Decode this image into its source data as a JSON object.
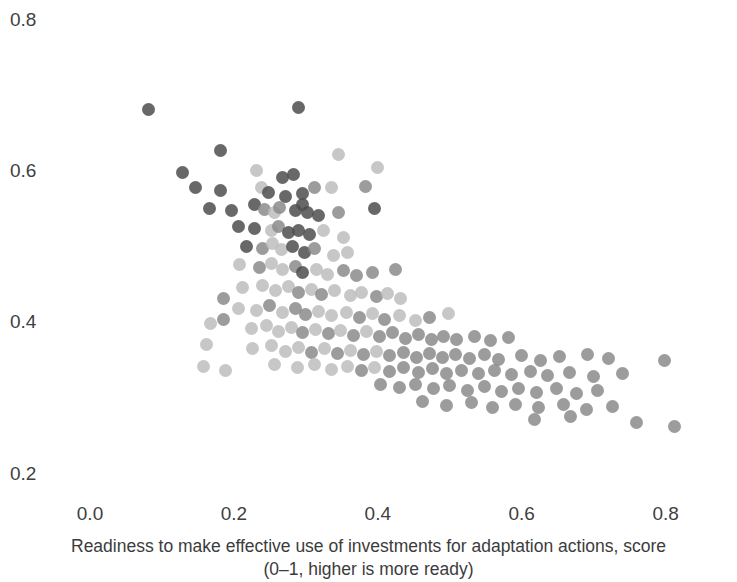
{
  "chart_data": {
    "type": "scatter",
    "title": "",
    "subtitle": "",
    "xlabel": "Readiness to make effective use of investments for adaptation actions, score (0–1, higher is more ready)",
    "xlabel_line1": "Readiness to make effective use of investments for adaptation actions, score",
    "xlabel_line2": "(0–1, higher is more ready)",
    "ylabel": "",
    "xlim": [
      -0.02,
      0.9
    ],
    "ylim": [
      0.175,
      0.82
    ],
    "xticks": [
      "0.0",
      "0.2",
      "0.4",
      "0.6",
      "0.8"
    ],
    "xtick_values": [
      0.0,
      0.2,
      0.4,
      0.6,
      0.8
    ],
    "yticks": [
      "0.2",
      "0.4",
      "0.6",
      "0.8"
    ],
    "ytick_values": [
      0.2,
      0.4,
      0.6,
      0.8
    ],
    "grid": false,
    "legend": "none",
    "marker": "circle",
    "marker_size_px": 13,
    "marker_opacity": 0.85,
    "colors": {
      "dark": "#4e4e4e",
      "medium": "#8b8b8b",
      "light": "#bdbdbd",
      "axis_text": "#3f3f3f",
      "label_text": "#3c3c3c",
      "background": "#ffffff"
    },
    "n_points": 185,
    "points": [
      {
        "x": 0.081,
        "y": 0.681,
        "c": "dark"
      },
      {
        "x": 0.29,
        "y": 0.684,
        "c": "dark"
      },
      {
        "x": 0.182,
        "y": 0.627,
        "c": "dark"
      },
      {
        "x": 0.345,
        "y": 0.622,
        "c": "light"
      },
      {
        "x": 0.4,
        "y": 0.605,
        "c": "light"
      },
      {
        "x": 0.128,
        "y": 0.598,
        "c": "dark"
      },
      {
        "x": 0.232,
        "y": 0.601,
        "c": "light"
      },
      {
        "x": 0.268,
        "y": 0.592,
        "c": "dark"
      },
      {
        "x": 0.283,
        "y": 0.596,
        "c": "dark"
      },
      {
        "x": 0.147,
        "y": 0.578,
        "c": "dark"
      },
      {
        "x": 0.182,
        "y": 0.575,
        "c": "dark"
      },
      {
        "x": 0.238,
        "y": 0.578,
        "c": "light"
      },
      {
        "x": 0.248,
        "y": 0.572,
        "c": "dark"
      },
      {
        "x": 0.272,
        "y": 0.566,
        "c": "dark"
      },
      {
        "x": 0.296,
        "y": 0.571,
        "c": "dark"
      },
      {
        "x": 0.312,
        "y": 0.578,
        "c": "medium"
      },
      {
        "x": 0.336,
        "y": 0.578,
        "c": "light"
      },
      {
        "x": 0.383,
        "y": 0.58,
        "c": "medium"
      },
      {
        "x": 0.166,
        "y": 0.551,
        "c": "dark"
      },
      {
        "x": 0.196,
        "y": 0.548,
        "c": "dark"
      },
      {
        "x": 0.228,
        "y": 0.556,
        "c": "dark"
      },
      {
        "x": 0.242,
        "y": 0.549,
        "c": "medium"
      },
      {
        "x": 0.256,
        "y": 0.546,
        "c": "light"
      },
      {
        "x": 0.264,
        "y": 0.552,
        "c": "medium"
      },
      {
        "x": 0.285,
        "y": 0.548,
        "c": "dark"
      },
      {
        "x": 0.295,
        "y": 0.556,
        "c": "dark"
      },
      {
        "x": 0.302,
        "y": 0.546,
        "c": "dark"
      },
      {
        "x": 0.318,
        "y": 0.542,
        "c": "dark"
      },
      {
        "x": 0.345,
        "y": 0.545,
        "c": "medium"
      },
      {
        "x": 0.395,
        "y": 0.551,
        "c": "dark"
      },
      {
        "x": 0.206,
        "y": 0.527,
        "c": "dark"
      },
      {
        "x": 0.228,
        "y": 0.524,
        "c": "dark"
      },
      {
        "x": 0.252,
        "y": 0.522,
        "c": "light"
      },
      {
        "x": 0.262,
        "y": 0.527,
        "c": "medium"
      },
      {
        "x": 0.276,
        "y": 0.519,
        "c": "dark"
      },
      {
        "x": 0.29,
        "y": 0.522,
        "c": "dark"
      },
      {
        "x": 0.305,
        "y": 0.516,
        "c": "dark"
      },
      {
        "x": 0.325,
        "y": 0.521,
        "c": "light"
      },
      {
        "x": 0.352,
        "y": 0.512,
        "c": "light"
      },
      {
        "x": 0.218,
        "y": 0.501,
        "c": "dark"
      },
      {
        "x": 0.24,
        "y": 0.498,
        "c": "medium"
      },
      {
        "x": 0.254,
        "y": 0.505,
        "c": "light"
      },
      {
        "x": 0.266,
        "y": 0.496,
        "c": "light"
      },
      {
        "x": 0.282,
        "y": 0.5,
        "c": "dark"
      },
      {
        "x": 0.298,
        "y": 0.492,
        "c": "dark"
      },
      {
        "x": 0.312,
        "y": 0.498,
        "c": "medium"
      },
      {
        "x": 0.338,
        "y": 0.489,
        "c": "light"
      },
      {
        "x": 0.358,
        "y": 0.493,
        "c": "light"
      },
      {
        "x": 0.208,
        "y": 0.476,
        "c": "light"
      },
      {
        "x": 0.236,
        "y": 0.472,
        "c": "medium"
      },
      {
        "x": 0.252,
        "y": 0.478,
        "c": "light"
      },
      {
        "x": 0.268,
        "y": 0.47,
        "c": "light"
      },
      {
        "x": 0.285,
        "y": 0.474,
        "c": "medium"
      },
      {
        "x": 0.296,
        "y": 0.466,
        "c": "dark"
      },
      {
        "x": 0.315,
        "y": 0.47,
        "c": "light"
      },
      {
        "x": 0.33,
        "y": 0.463,
        "c": "light"
      },
      {
        "x": 0.352,
        "y": 0.468,
        "c": "medium"
      },
      {
        "x": 0.37,
        "y": 0.462,
        "c": "medium"
      },
      {
        "x": 0.392,
        "y": 0.466,
        "c": "medium"
      },
      {
        "x": 0.425,
        "y": 0.47,
        "c": "medium"
      },
      {
        "x": 0.212,
        "y": 0.446,
        "c": "light"
      },
      {
        "x": 0.24,
        "y": 0.449,
        "c": "light"
      },
      {
        "x": 0.258,
        "y": 0.442,
        "c": "light"
      },
      {
        "x": 0.276,
        "y": 0.447,
        "c": "light"
      },
      {
        "x": 0.29,
        "y": 0.44,
        "c": "medium"
      },
      {
        "x": 0.308,
        "y": 0.444,
        "c": "light"
      },
      {
        "x": 0.322,
        "y": 0.437,
        "c": "medium"
      },
      {
        "x": 0.34,
        "y": 0.442,
        "c": "light"
      },
      {
        "x": 0.362,
        "y": 0.436,
        "c": "light"
      },
      {
        "x": 0.378,
        "y": 0.44,
        "c": "light"
      },
      {
        "x": 0.398,
        "y": 0.434,
        "c": "medium"
      },
      {
        "x": 0.414,
        "y": 0.438,
        "c": "light"
      },
      {
        "x": 0.432,
        "y": 0.432,
        "c": "light"
      },
      {
        "x": 0.186,
        "y": 0.432,
        "c": "medium"
      },
      {
        "x": 0.206,
        "y": 0.419,
        "c": "light"
      },
      {
        "x": 0.232,
        "y": 0.416,
        "c": "light"
      },
      {
        "x": 0.25,
        "y": 0.422,
        "c": "medium"
      },
      {
        "x": 0.268,
        "y": 0.413,
        "c": "light"
      },
      {
        "x": 0.286,
        "y": 0.418,
        "c": "medium"
      },
      {
        "x": 0.3,
        "y": 0.41,
        "c": "medium"
      },
      {
        "x": 0.318,
        "y": 0.415,
        "c": "light"
      },
      {
        "x": 0.336,
        "y": 0.409,
        "c": "light"
      },
      {
        "x": 0.356,
        "y": 0.413,
        "c": "light"
      },
      {
        "x": 0.374,
        "y": 0.406,
        "c": "medium"
      },
      {
        "x": 0.392,
        "y": 0.412,
        "c": "light"
      },
      {
        "x": 0.41,
        "y": 0.404,
        "c": "medium"
      },
      {
        "x": 0.43,
        "y": 0.409,
        "c": "light"
      },
      {
        "x": 0.452,
        "y": 0.403,
        "c": "light"
      },
      {
        "x": 0.472,
        "y": 0.407,
        "c": "medium"
      },
      {
        "x": 0.498,
        "y": 0.412,
        "c": "light"
      },
      {
        "x": 0.186,
        "y": 0.404,
        "c": "medium"
      },
      {
        "x": 0.168,
        "y": 0.398,
        "c": "light"
      },
      {
        "x": 0.224,
        "y": 0.392,
        "c": "light"
      },
      {
        "x": 0.246,
        "y": 0.396,
        "c": "light"
      },
      {
        "x": 0.262,
        "y": 0.388,
        "c": "light"
      },
      {
        "x": 0.28,
        "y": 0.393,
        "c": "light"
      },
      {
        "x": 0.296,
        "y": 0.386,
        "c": "medium"
      },
      {
        "x": 0.314,
        "y": 0.391,
        "c": "light"
      },
      {
        "x": 0.332,
        "y": 0.385,
        "c": "medium"
      },
      {
        "x": 0.348,
        "y": 0.389,
        "c": "light"
      },
      {
        "x": 0.366,
        "y": 0.383,
        "c": "medium"
      },
      {
        "x": 0.384,
        "y": 0.388,
        "c": "light"
      },
      {
        "x": 0.402,
        "y": 0.381,
        "c": "medium"
      },
      {
        "x": 0.42,
        "y": 0.386,
        "c": "medium"
      },
      {
        "x": 0.438,
        "y": 0.379,
        "c": "medium"
      },
      {
        "x": 0.456,
        "y": 0.384,
        "c": "medium"
      },
      {
        "x": 0.474,
        "y": 0.378,
        "c": "medium"
      },
      {
        "x": 0.492,
        "y": 0.382,
        "c": "medium"
      },
      {
        "x": 0.51,
        "y": 0.377,
        "c": "medium"
      },
      {
        "x": 0.534,
        "y": 0.382,
        "c": "medium"
      },
      {
        "x": 0.556,
        "y": 0.376,
        "c": "medium"
      },
      {
        "x": 0.582,
        "y": 0.38,
        "c": "medium"
      },
      {
        "x": 0.162,
        "y": 0.371,
        "c": "light"
      },
      {
        "x": 0.226,
        "y": 0.365,
        "c": "light"
      },
      {
        "x": 0.252,
        "y": 0.369,
        "c": "light"
      },
      {
        "x": 0.272,
        "y": 0.362,
        "c": "light"
      },
      {
        "x": 0.29,
        "y": 0.367,
        "c": "light"
      },
      {
        "x": 0.308,
        "y": 0.36,
        "c": "medium"
      },
      {
        "x": 0.326,
        "y": 0.365,
        "c": "light"
      },
      {
        "x": 0.344,
        "y": 0.359,
        "c": "medium"
      },
      {
        "x": 0.362,
        "y": 0.363,
        "c": "light"
      },
      {
        "x": 0.38,
        "y": 0.357,
        "c": "medium"
      },
      {
        "x": 0.398,
        "y": 0.362,
        "c": "light"
      },
      {
        "x": 0.416,
        "y": 0.356,
        "c": "medium"
      },
      {
        "x": 0.436,
        "y": 0.36,
        "c": "medium"
      },
      {
        "x": 0.454,
        "y": 0.354,
        "c": "medium"
      },
      {
        "x": 0.472,
        "y": 0.359,
        "c": "medium"
      },
      {
        "x": 0.49,
        "y": 0.353,
        "c": "medium"
      },
      {
        "x": 0.508,
        "y": 0.358,
        "c": "medium"
      },
      {
        "x": 0.528,
        "y": 0.352,
        "c": "medium"
      },
      {
        "x": 0.548,
        "y": 0.357,
        "c": "medium"
      },
      {
        "x": 0.568,
        "y": 0.351,
        "c": "medium"
      },
      {
        "x": 0.6,
        "y": 0.356,
        "c": "medium"
      },
      {
        "x": 0.626,
        "y": 0.35,
        "c": "medium"
      },
      {
        "x": 0.652,
        "y": 0.355,
        "c": "medium"
      },
      {
        "x": 0.692,
        "y": 0.358,
        "c": "medium"
      },
      {
        "x": 0.72,
        "y": 0.352,
        "c": "medium"
      },
      {
        "x": 0.798,
        "y": 0.349,
        "c": "medium"
      },
      {
        "x": 0.256,
        "y": 0.344,
        "c": "light"
      },
      {
        "x": 0.288,
        "y": 0.34,
        "c": "light"
      },
      {
        "x": 0.312,
        "y": 0.344,
        "c": "light"
      },
      {
        "x": 0.336,
        "y": 0.338,
        "c": "light"
      },
      {
        "x": 0.358,
        "y": 0.342,
        "c": "light"
      },
      {
        "x": 0.378,
        "y": 0.336,
        "c": "medium"
      },
      {
        "x": 0.396,
        "y": 0.341,
        "c": "light"
      },
      {
        "x": 0.416,
        "y": 0.335,
        "c": "medium"
      },
      {
        "x": 0.436,
        "y": 0.34,
        "c": "medium"
      },
      {
        "x": 0.456,
        "y": 0.334,
        "c": "medium"
      },
      {
        "x": 0.476,
        "y": 0.339,
        "c": "medium"
      },
      {
        "x": 0.496,
        "y": 0.333,
        "c": "medium"
      },
      {
        "x": 0.516,
        "y": 0.337,
        "c": "medium"
      },
      {
        "x": 0.54,
        "y": 0.332,
        "c": "medium"
      },
      {
        "x": 0.562,
        "y": 0.336,
        "c": "medium"
      },
      {
        "x": 0.586,
        "y": 0.331,
        "c": "medium"
      },
      {
        "x": 0.612,
        "y": 0.335,
        "c": "medium"
      },
      {
        "x": 0.636,
        "y": 0.33,
        "c": "medium"
      },
      {
        "x": 0.666,
        "y": 0.334,
        "c": "medium"
      },
      {
        "x": 0.7,
        "y": 0.329,
        "c": "medium"
      },
      {
        "x": 0.74,
        "y": 0.333,
        "c": "medium"
      },
      {
        "x": 0.158,
        "y": 0.342,
        "c": "light"
      },
      {
        "x": 0.188,
        "y": 0.336,
        "c": "light"
      },
      {
        "x": 0.404,
        "y": 0.318,
        "c": "medium"
      },
      {
        "x": 0.43,
        "y": 0.314,
        "c": "medium"
      },
      {
        "x": 0.452,
        "y": 0.318,
        "c": "medium"
      },
      {
        "x": 0.478,
        "y": 0.312,
        "c": "medium"
      },
      {
        "x": 0.5,
        "y": 0.316,
        "c": "medium"
      },
      {
        "x": 0.524,
        "y": 0.31,
        "c": "medium"
      },
      {
        "x": 0.548,
        "y": 0.315,
        "c": "medium"
      },
      {
        "x": 0.572,
        "y": 0.309,
        "c": "medium"
      },
      {
        "x": 0.596,
        "y": 0.313,
        "c": "medium"
      },
      {
        "x": 0.62,
        "y": 0.307,
        "c": "medium"
      },
      {
        "x": 0.648,
        "y": 0.312,
        "c": "medium"
      },
      {
        "x": 0.676,
        "y": 0.306,
        "c": "medium"
      },
      {
        "x": 0.706,
        "y": 0.31,
        "c": "medium"
      },
      {
        "x": 0.462,
        "y": 0.295,
        "c": "medium"
      },
      {
        "x": 0.496,
        "y": 0.29,
        "c": "medium"
      },
      {
        "x": 0.53,
        "y": 0.294,
        "c": "medium"
      },
      {
        "x": 0.56,
        "y": 0.288,
        "c": "medium"
      },
      {
        "x": 0.592,
        "y": 0.292,
        "c": "medium"
      },
      {
        "x": 0.624,
        "y": 0.287,
        "c": "medium"
      },
      {
        "x": 0.658,
        "y": 0.291,
        "c": "medium"
      },
      {
        "x": 0.69,
        "y": 0.285,
        "c": "medium"
      },
      {
        "x": 0.726,
        "y": 0.289,
        "c": "medium"
      },
      {
        "x": 0.618,
        "y": 0.272,
        "c": "medium"
      },
      {
        "x": 0.668,
        "y": 0.276,
        "c": "medium"
      },
      {
        "x": 0.76,
        "y": 0.268,
        "c": "medium"
      },
      {
        "x": 0.812,
        "y": 0.262,
        "c": "medium"
      }
    ]
  },
  "axes": {
    "x": {
      "ticks": [
        {
          "label": "0.0",
          "value": 0.0
        },
        {
          "label": "0.2",
          "value": 0.2
        },
        {
          "label": "0.4",
          "value": 0.4
        },
        {
          "label": "0.6",
          "value": 0.6
        },
        {
          "label": "0.8",
          "value": 0.8
        }
      ],
      "title_line1": "Readiness to make effective use of investments for adaptation actions, score",
      "title_line2": "(0–1, higher is more ready)"
    },
    "y": {
      "ticks": [
        {
          "label": "0.8",
          "value": 0.8
        },
        {
          "label": "0.6",
          "value": 0.6
        },
        {
          "label": "0.4",
          "value": 0.4
        },
        {
          "label": "0.2",
          "value": 0.2
        }
      ],
      "title": ""
    }
  }
}
